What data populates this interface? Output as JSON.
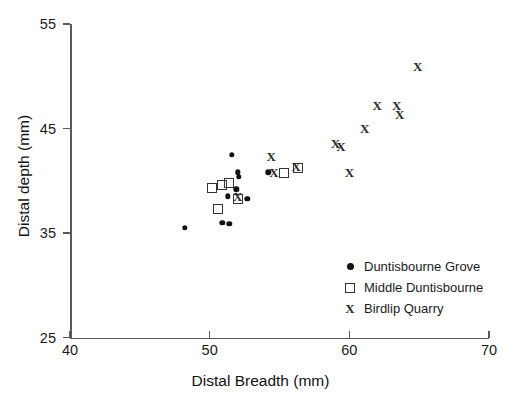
{
  "chart_data": {
    "type": "scatter",
    "title": "",
    "xlabel": "Distal Breadth (mm)",
    "ylabel": "Distal depth (mm)",
    "xlim": [
      40,
      70
    ],
    "ylim": [
      25,
      55
    ],
    "xticks": [
      40,
      50,
      60,
      70
    ],
    "yticks": [
      25,
      35,
      45,
      55
    ],
    "grid": false,
    "legend_position": "lower-right",
    "series": [
      {
        "name": "Duntisbourne Grove",
        "marker": "filled-circle",
        "color": "#111111",
        "points": [
          [
            48.2,
            35.5
          ],
          [
            50.9,
            36.0
          ],
          [
            51.3,
            38.5
          ],
          [
            51.6,
            42.5
          ],
          [
            51.4,
            35.9
          ],
          [
            52.0,
            40.8
          ],
          [
            52.1,
            40.4
          ],
          [
            51.9,
            39.2
          ],
          [
            54.2,
            40.8
          ],
          [
            52.7,
            38.3
          ]
        ]
      },
      {
        "name": "Middle Duntisbourne",
        "marker": "open-square",
        "color": "#333333",
        "points": [
          [
            50.2,
            39.3
          ],
          [
            50.6,
            37.3
          ],
          [
            50.9,
            39.6
          ],
          [
            51.4,
            39.8
          ],
          [
            52.0,
            38.3
          ],
          [
            55.3,
            40.7
          ],
          [
            56.3,
            41.2
          ]
        ]
      },
      {
        "name": "Birdlip Quarry",
        "marker": "x",
        "color": "#2b2b2b",
        "points": [
          [
            52.0,
            38.4
          ],
          [
            54.4,
            42.3
          ],
          [
            54.6,
            40.7
          ],
          [
            56.2,
            41.3
          ],
          [
            59.0,
            43.5
          ],
          [
            59.4,
            43.2
          ],
          [
            60.0,
            40.7
          ],
          [
            61.1,
            45.0
          ],
          [
            62.0,
            47.2
          ],
          [
            63.4,
            47.2
          ],
          [
            63.6,
            46.3
          ],
          [
            64.9,
            50.9
          ]
        ]
      }
    ]
  },
  "legend": {
    "items": [
      {
        "label": "Duntisbourne Grove",
        "marker": "filled-circle"
      },
      {
        "label": "Middle Duntisbourne",
        "marker": "open-square"
      },
      {
        "label": "Birdlip Quarry",
        "marker": "x"
      }
    ]
  },
  "markers": {
    "x_glyph": "X"
  }
}
